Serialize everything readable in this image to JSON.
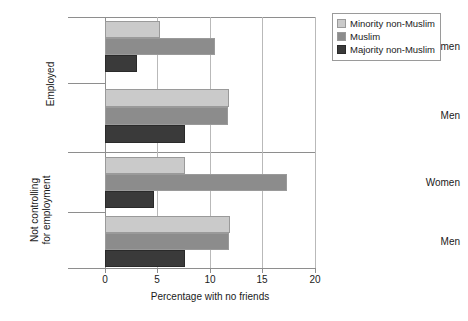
{
  "chart_data": {
    "type": "bar",
    "orientation": "horizontal",
    "title": "",
    "xlabel": "Percentage with no friends",
    "ylabel": "",
    "xlim": [
      0,
      20
    ],
    "xticks": [
      0,
      5,
      10,
      15,
      20
    ],
    "xtick_labels": [
      "0",
      "5",
      "10",
      "15",
      "20"
    ],
    "grid": "vertical",
    "legend_position": "top-right",
    "legend_entries": [
      "Minority non-Muslim",
      "Muslim",
      "Majority non-Muslim"
    ],
    "series": [
      {
        "name": "Minority non-Muslim",
        "color": "#cacaca",
        "values": [
          5.2,
          11.8,
          7.6,
          11.9
        ]
      },
      {
        "name": "Muslim",
        "color": "#8c8c8c",
        "values": [
          10.5,
          11.7,
          17.3,
          11.8
        ]
      },
      {
        "name": "Majority non-Muslim",
        "color": "#3a3a3a",
        "values": [
          3.0,
          7.6,
          4.7,
          7.6
        ]
      }
    ],
    "categories": [
      "Women",
      "Men",
      "Women",
      "Men"
    ],
    "group_labels": [
      "Employed",
      "Not controlling for employment"
    ],
    "groups": [
      {
        "label": "Employed",
        "categories": [
          {
            "label": "Women",
            "bars": [
              {
                "series": "Minority non-Muslim",
                "value": 5.2
              },
              {
                "series": "Muslim",
                "value": 10.5
              },
              {
                "series": "Majority non-Muslim",
                "value": 3.0
              }
            ]
          },
          {
            "label": "Men",
            "bars": [
              {
                "series": "Minority non-Muslim",
                "value": 11.8
              },
              {
                "series": "Muslim",
                "value": 11.7
              },
              {
                "series": "Majority non-Muslim",
                "value": 7.6
              }
            ]
          }
        ]
      },
      {
        "label": "Not controlling for employment",
        "label_lines": [
          "Not controlling",
          "for employment"
        ],
        "categories": [
          {
            "label": "Women",
            "bars": [
              {
                "series": "Minority non-Muslim",
                "value": 7.6
              },
              {
                "series": "Muslim",
                "value": 17.3
              },
              {
                "series": "Majority non-Muslim",
                "value": 4.7
              }
            ]
          },
          {
            "label": "Men",
            "bars": [
              {
                "series": "Minority non-Muslim",
                "value": 11.9
              },
              {
                "series": "Muslim",
                "value": 11.8
              },
              {
                "series": "Majority non-Muslim",
                "value": 7.6
              }
            ]
          }
        ]
      }
    ]
  },
  "colors": {
    "minority_non_muslim": "#cacaca",
    "muslim": "#8c8c8c",
    "majority_non_muslim": "#3a3a3a",
    "axis": "#8e8e8e",
    "gridline": "#b9b9b9",
    "background": "#ffffff"
  },
  "legend": {
    "rows": [
      {
        "label": "Minority non-Muslim"
      },
      {
        "label": "Muslim"
      },
      {
        "label": "Majority non-Muslim"
      }
    ]
  },
  "axis": {
    "x_title": "Percentage with no friends",
    "ticks": [
      {
        "label": "0"
      },
      {
        "label": "5"
      },
      {
        "label": "10"
      },
      {
        "label": "15"
      },
      {
        "label": "20"
      }
    ]
  },
  "categories": {
    "employed_women": "Women",
    "employed_men": "Men",
    "notctrl_women": "Women",
    "notctrl_men": "Men"
  },
  "groups": {
    "employed": "Employed",
    "notctrl_line1": "Not controlling",
    "notctrl_line2": "for employment"
  }
}
